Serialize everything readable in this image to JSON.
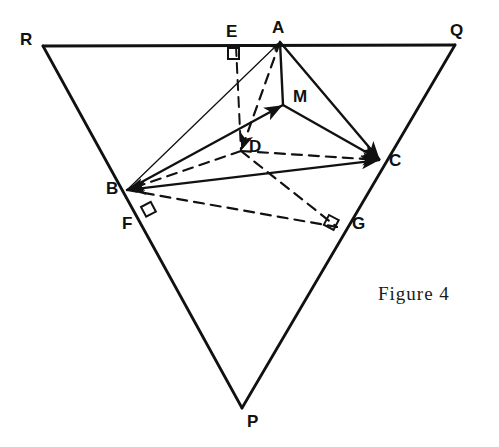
{
  "figure": {
    "caption": "Figure 4",
    "caption_position": {
      "x": 378,
      "y": 283
    },
    "width": 499,
    "height": 447,
    "background_color": "#ffffff",
    "ink_color": "#111111"
  },
  "labels": [
    {
      "id": "R",
      "text": "R",
      "x": 20,
      "y": 31
    },
    {
      "id": "E",
      "text": "E",
      "x": 226,
      "y": 23
    },
    {
      "id": "A",
      "text": "A",
      "x": 272,
      "y": 19
    },
    {
      "id": "Q",
      "text": "Q",
      "x": 450,
      "y": 22
    },
    {
      "id": "M",
      "text": "M",
      "x": 293,
      "y": 88
    },
    {
      "id": "D",
      "text": "D",
      "x": 249,
      "y": 138
    },
    {
      "id": "C",
      "text": "C",
      "x": 389,
      "y": 152
    },
    {
      "id": "B",
      "text": "B",
      "x": 106,
      "y": 180
    },
    {
      "id": "F",
      "text": "F",
      "x": 122,
      "y": 215
    },
    {
      "id": "G",
      "text": "G",
      "x": 352,
      "y": 215
    },
    {
      "id": "P",
      "text": "P",
      "x": 247,
      "y": 413
    }
  ],
  "points": {
    "R": {
      "x": 43,
      "y": 46
    },
    "Q": {
      "x": 455,
      "y": 45
    },
    "P": {
      "x": 242,
      "y": 408
    },
    "A": {
      "x": 280,
      "y": 42
    },
    "B": {
      "x": 127,
      "y": 190
    },
    "C": {
      "x": 380,
      "y": 160
    },
    "D": {
      "x": 241,
      "y": 151
    },
    "M": {
      "x": 283,
      "y": 105
    },
    "E": {
      "x": 236,
      "y": 46
    },
    "F": {
      "x": 151,
      "y": 219
    },
    "G": {
      "x": 337,
      "y": 227
    }
  },
  "outer_triangle": {
    "name": "triangle-RQP",
    "vertices": [
      "R",
      "Q",
      "P"
    ],
    "style": "solid",
    "stroke_width": 2.6
  },
  "segments": [
    {
      "id": "seg-RQ",
      "from": "R",
      "to": "Q",
      "style": "solid",
      "width": 2.8,
      "arrow": "none"
    },
    {
      "id": "seg-RP",
      "from": "R",
      "to": "P",
      "style": "solid",
      "width": 2.8,
      "arrow": "none"
    },
    {
      "id": "seg-QP",
      "from": "Q",
      "to": "P",
      "style": "solid",
      "width": 2.8,
      "arrow": "none"
    },
    {
      "id": "seg-BA",
      "from": "B",
      "to": "A",
      "style": "solid",
      "width": 1.3,
      "arrow": "end"
    },
    {
      "id": "seg-BM",
      "from": "B",
      "to": "M",
      "style": "solid",
      "width": 2.4,
      "arrow": "end"
    },
    {
      "id": "seg-BC",
      "from": "B",
      "to": "C",
      "style": "solid",
      "width": 2.4,
      "arrow": "both"
    },
    {
      "id": "seg-AM",
      "from": "A",
      "to": "M",
      "style": "solid",
      "width": 2.4,
      "arrow": "none"
    },
    {
      "id": "seg-AC",
      "from": "A",
      "to": "C",
      "style": "solid",
      "width": 2.4,
      "arrow": "end"
    },
    {
      "id": "seg-MC",
      "from": "M",
      "to": "C",
      "style": "solid",
      "width": 2.4,
      "arrow": "end"
    },
    {
      "id": "seg-AD",
      "from": "A",
      "to": "D",
      "style": "dashed",
      "width": 2.2,
      "arrow": "end"
    },
    {
      "id": "seg-ED",
      "from": "E",
      "to": "D",
      "style": "dashed",
      "width": 2.0,
      "arrow": "none"
    },
    {
      "id": "seg-DC",
      "from": "D",
      "to": "C",
      "style": "dashed",
      "width": 2.2,
      "arrow": "end"
    },
    {
      "id": "seg-DB",
      "from": "D",
      "to": "B",
      "style": "dashed",
      "width": 2.2,
      "arrow": "end"
    },
    {
      "id": "seg-DG",
      "from": "D",
      "to": "G",
      "style": "dashed",
      "width": 2.2,
      "arrow": "none"
    },
    {
      "id": "seg-BG",
      "from": "B",
      "to": "G",
      "style": "dashed",
      "width": 2.2,
      "arrow": "none"
    }
  ],
  "right_angle_marks": [
    {
      "id": "right-angle-E",
      "at": "E",
      "x": 228,
      "y": 48,
      "size": 11,
      "rotation": 0
    },
    {
      "id": "right-angle-F",
      "at": "F",
      "x": 141,
      "y": 207,
      "size": 11,
      "rotation": -28
    },
    {
      "id": "right-angle-G",
      "at": "G",
      "x": 329,
      "y": 215,
      "size": 11,
      "rotation": 28
    }
  ]
}
